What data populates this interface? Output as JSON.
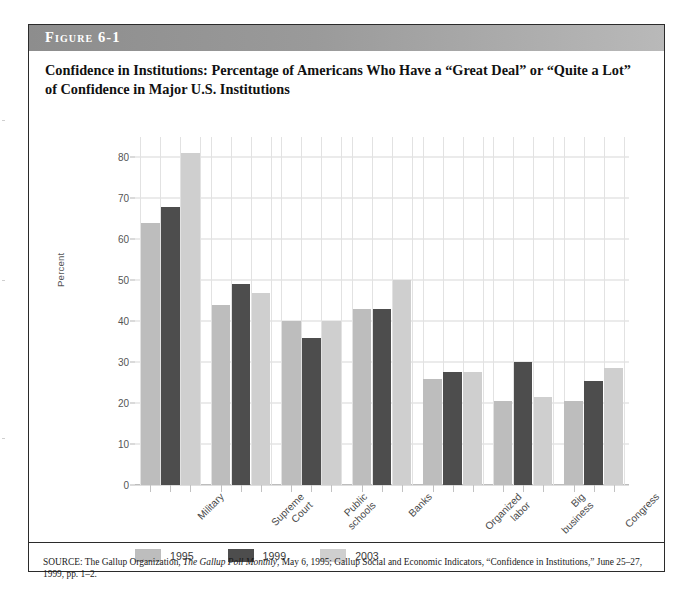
{
  "figure": {
    "label": "Figure 6-1",
    "title": "Confidence in Institutions: Percentage of Americans Who Have a “Great Deal” or “Quite a Lot” of Confidence in Major U.S. Institutions",
    "source": "SOURCE: The Gallup Organization, The Gallup Poll Monthly, May 6, 1995; Gallup Social and Economic Indicators, “Confidence in Institutions,” June 25–27, 1999, pp. 1–2.",
    "source_italic_part": "The Gallup Poll Monthly"
  },
  "colors": {
    "series_1995": "#bdbdbd",
    "series_1999": "#4d4d4d",
    "series_2003": "#cfcfcf",
    "header_band": "#8d8d8d",
    "frame": "#2b2b2b",
    "gridline": "#d8d8d8",
    "axis_text": "#555555"
  },
  "chart_data": {
    "type": "bar",
    "title": "Confidence in Institutions: Percentage of Americans Who Have a “Great Deal” or “Quite a Lot” of Confidence in Major U.S. Institutions",
    "xlabel": "",
    "ylabel": "Percent",
    "ylim": [
      0,
      85
    ],
    "yticks": [
      0,
      10,
      20,
      30,
      40,
      50,
      60,
      70,
      80
    ],
    "ytick_labels": [
      "0",
      "10",
      "20",
      "30",
      "40",
      "50",
      "60",
      "70",
      "80"
    ],
    "grid": true,
    "legend_position": "bottom-left",
    "categories": [
      "Military",
      "Supreme\nCourt",
      "Public\nschools",
      "Banks",
      "Organized\nlabor",
      "Big\nbusiness",
      "Congress"
    ],
    "series": [
      {
        "name": "1995",
        "color": "#bdbdbd",
        "values": [
          64,
          44,
          40,
          43,
          26,
          20.5,
          20.5
        ]
      },
      {
        "name": "1999",
        "color": "#4d4d4d",
        "values": [
          68,
          49,
          36,
          43,
          27.5,
          30,
          25.5
        ]
      },
      {
        "name": "2003",
        "color": "#cfcfcf",
        "values": [
          81,
          47,
          40,
          50,
          27.5,
          21.5,
          28.5
        ]
      }
    ]
  }
}
